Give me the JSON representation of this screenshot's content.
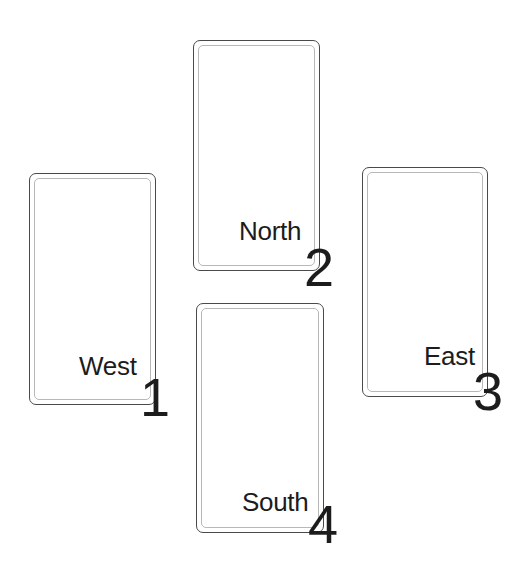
{
  "diagram": {
    "type": "card-layout",
    "positions": [
      {
        "id": "west",
        "label": "West",
        "number": "1",
        "card": {
          "x": 29,
          "y": 173,
          "w": 127,
          "h": 232
        },
        "label_pos": {
          "x": 79,
          "y": 353
        },
        "number_pos": {
          "x": 140,
          "y": 370
        }
      },
      {
        "id": "north",
        "label": "North",
        "number": "2",
        "card": {
          "x": 193,
          "y": 40,
          "w": 127,
          "h": 231
        },
        "label_pos": {
          "x": 239,
          "y": 218
        },
        "number_pos": {
          "x": 304,
          "y": 240
        }
      },
      {
        "id": "east",
        "label": "East",
        "number": "3",
        "card": {
          "x": 362,
          "y": 167,
          "w": 126,
          "h": 230
        },
        "label_pos": {
          "x": 424,
          "y": 343
        },
        "number_pos": {
          "x": 473,
          "y": 364
        }
      },
      {
        "id": "south",
        "label": "South",
        "number": "4",
        "card": {
          "x": 196,
          "y": 303,
          "w": 128,
          "h": 230
        },
        "label_pos": {
          "x": 242,
          "y": 489
        },
        "number_pos": {
          "x": 308,
          "y": 497
        }
      }
    ],
    "colors": {
      "card_border": "#4a4a4a",
      "card_inner_border": "#b8b8b8",
      "text": "#1c1c1c",
      "background": "#ffffff"
    }
  }
}
